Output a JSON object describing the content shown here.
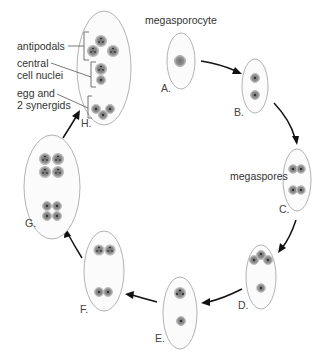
{
  "diagram": {
    "labels": {
      "megasporocyte": "megasporocyte",
      "megaspores": "megaspores",
      "antipodals": "antipodals",
      "central_line1": "central",
      "central_line2": "cell nuclei",
      "egg_line1": "egg and",
      "egg_line2": "2 synergids"
    },
    "stages": [
      {
        "id": "A",
        "label": "A.",
        "nuclei": 1
      },
      {
        "id": "B",
        "label": "B.",
        "nuclei": 2
      },
      {
        "id": "C",
        "label": "C.",
        "nuclei": 4
      },
      {
        "id": "D",
        "label": "D.",
        "nuclei": 4
      },
      {
        "id": "E",
        "label": "E.",
        "nuclei": 2
      },
      {
        "id": "F",
        "label": "F.",
        "nuclei": 4
      },
      {
        "id": "G",
        "label": "G.",
        "nuclei": 8
      },
      {
        "id": "H",
        "label": "H.",
        "nuclei": 8
      }
    ],
    "flow": [
      "A",
      "B",
      "C",
      "D",
      "E",
      "F",
      "G",
      "H"
    ],
    "colors": {
      "cell_outline": "#a9a9a9",
      "nucleus": "#8c8c8c",
      "arrow": "#111111",
      "text": "#333333"
    }
  }
}
